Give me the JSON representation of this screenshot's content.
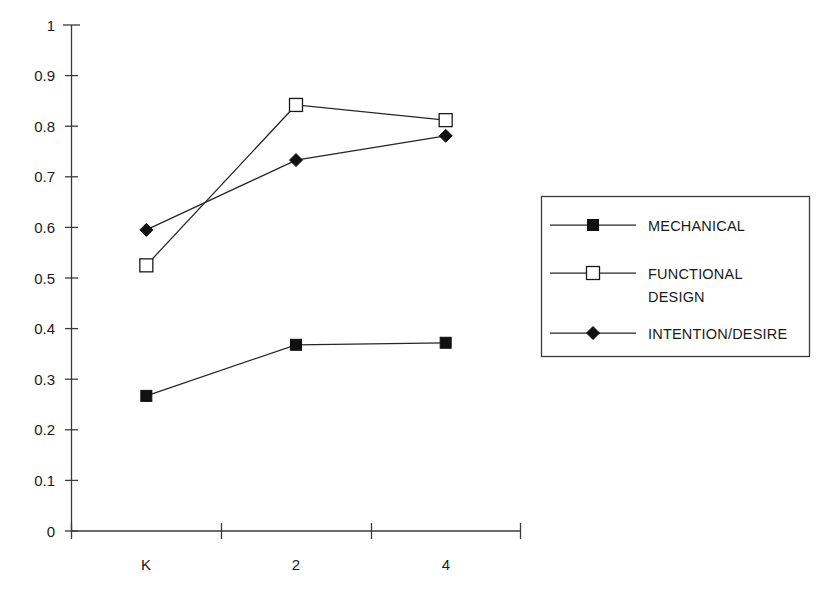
{
  "chart_data": {
    "type": "line",
    "title": "",
    "xlabel": "",
    "ylabel": "",
    "categories": [
      "K",
      "2",
      "4"
    ],
    "ylim": [
      0,
      1
    ],
    "y_ticks": [
      "0",
      "0.1",
      "0.2",
      "0.3",
      "0.4",
      "0.5",
      "0.6",
      "0.7",
      "0.8",
      "0.9",
      "1"
    ],
    "y_tick_values": [
      0,
      0.1,
      0.2,
      0.3,
      0.4,
      0.5,
      0.6,
      0.7,
      0.8,
      0.9,
      1
    ],
    "grid": false,
    "legend_position": "right",
    "series": [
      {
        "name": "MECHANICAL",
        "marker": "filled-square",
        "values": [
          0.267,
          0.368,
          0.372
        ]
      },
      {
        "name": "FUNCTIONAL DESIGN",
        "marker": "open-square",
        "values": [
          0.525,
          0.842,
          0.812
        ]
      },
      {
        "name": "INTENTION/DESIRE",
        "marker": "filled-diamond",
        "values": [
          0.595,
          0.733,
          0.781
        ]
      }
    ]
  },
  "legend": {
    "entries": [
      {
        "label": "MECHANICAL"
      },
      {
        "label_line1": "FUNCTIONAL",
        "label_line2": "DESIGN"
      },
      {
        "label": "INTENTION/DESIRE"
      }
    ]
  },
  "axis": {
    "x_labels": [
      "K",
      "2",
      "4"
    ],
    "y_labels": [
      "1",
      "0.9",
      "0.8",
      "0.7",
      "0.6",
      "0.5",
      "0.4",
      "0.3",
      "0.2",
      "0.1",
      "0"
    ]
  },
  "colors": {
    "line": "#262626",
    "axis": "#3a3a3a",
    "marker_fill": "#101010",
    "marker_open_fill": "#ffffff",
    "background": "#ffffff"
  }
}
